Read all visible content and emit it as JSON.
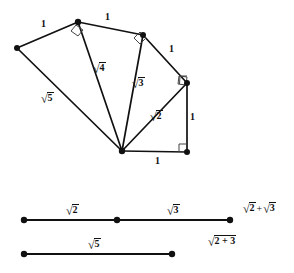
{
  "figure": {
    "canvas": {
      "width": 294,
      "height": 273
    },
    "stroke_color": "#111111",
    "fill_color": "#ffffff",
    "background": "#ffffff",
    "spiral": {
      "hub": {
        "x": 122,
        "y": 151
      },
      "vertices": [
        {
          "name": "vertex-origin",
          "x": 122,
          "y": 151
        },
        {
          "name": "vertex-bottom-right",
          "x": 187,
          "y": 152
        },
        {
          "name": "vertex-right",
          "x": 187,
          "y": 83
        },
        {
          "name": "vertex-upper-right",
          "x": 143,
          "y": 35
        },
        {
          "name": "vertex-apex",
          "x": 78,
          "y": 22
        },
        {
          "name": "vertex-left",
          "x": 17,
          "y": 48
        }
      ],
      "right_angle_marks": [
        {
          "name": "right-angle-bottom-right",
          "x": 187,
          "y": 152
        },
        {
          "name": "right-angle-right",
          "x": 187,
          "y": 83
        },
        {
          "name": "right-angle-upper-right",
          "x": 143,
          "y": 35
        },
        {
          "name": "right-angle-apex",
          "x": 78,
          "y": 22
        }
      ],
      "labels": [
        {
          "name": "label-unit-bottom",
          "text": "1",
          "kind": "plain",
          "x": 155,
          "y": 156
        },
        {
          "name": "label-unit-right",
          "text": "1",
          "kind": "plain",
          "x": 190,
          "y": 112
        },
        {
          "name": "label-unit-upper-right",
          "text": "1",
          "kind": "plain",
          "x": 169,
          "y": 44
        },
        {
          "name": "label-unit-top-right",
          "text": "1",
          "kind": "plain",
          "x": 105,
          "y": 12
        },
        {
          "name": "label-unit-top-left",
          "text": "1",
          "kind": "plain",
          "x": 41,
          "y": 19
        },
        {
          "name": "label-sqrt2",
          "radicand": "2",
          "kind": "radical",
          "x": 150,
          "y": 111
        },
        {
          "name": "label-sqrt3",
          "radicand": "3",
          "kind": "radical",
          "x": 132,
          "y": 78
        },
        {
          "name": "label-sqrt4",
          "radicand": "4",
          "kind": "radical",
          "x": 93,
          "y": 63
        },
        {
          "name": "label-sqrt5",
          "radicand": "5",
          "kind": "radical",
          "x": 41,
          "y": 93
        }
      ]
    },
    "segments": {
      "line_top": {
        "name": "segment-line-sqrt2-plus-sqrt3",
        "y": 220,
        "x_start": 24,
        "x_mid": 117,
        "x_end": 230,
        "endpoints": [
          "left-endpoint-dot",
          "middle-endpoint-dot",
          "right-endpoint-dot"
        ],
        "labels": [
          {
            "name": "label-segment-sqrt2",
            "radicand": "2",
            "kind": "radical",
            "x": 66,
            "y": 205
          },
          {
            "name": "label-segment-sqrt3",
            "radicand": "3",
            "kind": "radical",
            "x": 167,
            "y": 205
          },
          {
            "name": "label-segment-sum",
            "kind": "sum",
            "left_radicand": "2",
            "right_radicand": "3",
            "operator": "+",
            "x": 243,
            "y": 203
          }
        ]
      },
      "line_bottom": {
        "name": "segment-line-sqrt5",
        "y": 254,
        "x_start": 24,
        "x_end": 172,
        "endpoints": [
          "left-endpoint-dot",
          "right-endpoint-dot"
        ],
        "labels": [
          {
            "name": "label-segment-sqrt5",
            "radicand": "5",
            "kind": "radical",
            "x": 88,
            "y": 239
          },
          {
            "name": "label-segment-sqrt-of-sum",
            "kind": "radical",
            "radicand": "2 + 3",
            "x": 208,
            "y": 236
          }
        ]
      }
    }
  }
}
